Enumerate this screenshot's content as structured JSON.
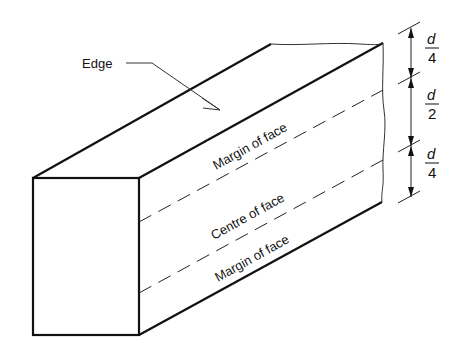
{
  "diagram": {
    "type": "timber-face-zones",
    "labels": {
      "edge": "Edge",
      "margin_top": "Margin of face",
      "centre": "Centre of face",
      "margin_bottom": "Margin of face"
    },
    "dimensions": [
      {
        "numerator": "d",
        "denominator": "4"
      },
      {
        "numerator": "d",
        "denominator": "2"
      },
      {
        "numerator": "d",
        "denominator": "4"
      }
    ],
    "colors": {
      "line": "#111111",
      "background": "#ffffff"
    }
  }
}
